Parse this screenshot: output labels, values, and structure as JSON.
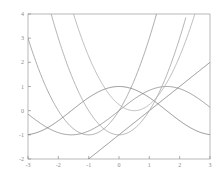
{
  "chart_data": {
    "type": "line",
    "title": "",
    "xlabel": "",
    "ylabel": "",
    "xlim": [
      -3,
      3
    ],
    "ylim": [
      -2,
      4
    ],
    "grid": false,
    "legend": "none",
    "xticks": [
      -3,
      -2,
      -1,
      0,
      1,
      2,
      3
    ],
    "yticks": [
      -2,
      -1,
      0,
      1,
      2,
      3,
      4
    ],
    "xtick_labels": [
      "-3",
      "-2",
      "-1",
      "0",
      "1",
      "2",
      "3"
    ],
    "ytick_labels": [
      "-2",
      "-1",
      "0",
      "1",
      "2",
      "3",
      "4"
    ],
    "series": [
      {
        "name": "sin(x)",
        "color": "#808080",
        "expr": "sin",
        "x": [
          -3,
          -2.75,
          -2.5,
          -2.25,
          -2,
          -1.75,
          -1.5,
          -1.25,
          -1,
          -0.75,
          -0.5,
          -0.25,
          0,
          0.25,
          0.5,
          0.75,
          1,
          1.25,
          1.5,
          1.75,
          2,
          2.25,
          2.5,
          2.75,
          3
        ],
        "values": [
          -0.14,
          -0.38,
          -0.6,
          -0.78,
          -0.91,
          -0.98,
          -1.0,
          -0.95,
          -0.84,
          -0.68,
          -0.48,
          -0.25,
          0.0,
          0.25,
          0.48,
          0.68,
          0.84,
          0.95,
          1.0,
          0.98,
          0.91,
          0.78,
          0.6,
          0.38,
          0.14
        ]
      },
      {
        "name": "cos(x)",
        "color": "#707070",
        "expr": "cos",
        "x": [
          -3,
          -2.75,
          -2.5,
          -2.25,
          -2,
          -1.75,
          -1.5,
          -1.25,
          -1,
          -0.75,
          -0.5,
          -0.25,
          0,
          0.25,
          0.5,
          0.75,
          1,
          1.25,
          1.5,
          1.75,
          2,
          2.25,
          2.5,
          2.75,
          3
        ],
        "values": [
          -0.99,
          -0.92,
          -0.8,
          -0.63,
          -0.42,
          -0.18,
          0.07,
          0.32,
          0.54,
          0.73,
          0.88,
          0.97,
          1.0,
          0.97,
          0.88,
          0.73,
          0.54,
          0.32,
          0.07,
          -0.18,
          -0.42,
          -0.63,
          -0.8,
          -0.92,
          -0.99
        ]
      },
      {
        "name": "x - 1",
        "color": "#6e6e6e",
        "expr": "line",
        "x": [
          -1,
          3
        ],
        "values": [
          -2,
          2.1
        ]
      },
      {
        "name": "x^2 - 1",
        "color": "#9a9a9a",
        "expr": "parabola-a",
        "x": [
          -2.25,
          -2,
          -1.5,
          -1,
          -0.5,
          0,
          0.5,
          1,
          1.5,
          2,
          2.2
        ],
        "values": [
          4.06,
          3.0,
          1.25,
          0.0,
          -0.75,
          -1.0,
          -0.75,
          0.0,
          1.25,
          3.0,
          3.84
        ]
      },
      {
        "name": "(x+1)^2 - 1",
        "color": "#8f8f8f",
        "expr": "parabola-b",
        "x": [
          -3.0,
          -2.5,
          -2,
          -1.5,
          -1,
          -0.5,
          0,
          0.5,
          1,
          1.24
        ],
        "values": [
          3.0,
          1.25,
          0.0,
          -0.75,
          -1.0,
          -0.75,
          0.0,
          1.25,
          3.0,
          4.0
        ]
      },
      {
        "name": "(x-0.5)^2",
        "color": "#a5a5a5",
        "expr": "parabola-c",
        "x": [
          -1.5,
          -1,
          -0.5,
          0,
          0.5,
          1,
          1.5,
          2,
          2.5
        ],
        "values": [
          4.0,
          2.25,
          1.0,
          0.25,
          0.0,
          0.25,
          1.0,
          2.25,
          4.0
        ]
      }
    ]
  },
  "figure": {
    "background_color": "#ffffff",
    "axis_color": "#9a9a9a",
    "tick_color": "#8a8a8a",
    "plot_left_px": 28,
    "plot_right_px": 210,
    "plot_top_px": 14,
    "plot_bottom_px": 159
  }
}
